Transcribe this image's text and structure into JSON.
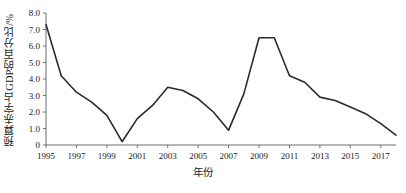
{
  "chart_data": {
    "type": "line",
    "title": "",
    "xlabel": "年份",
    "ylabel": "预算赤字占GDP的百分比/%",
    "xlim": [
      1995,
      2018
    ],
    "ylim": [
      0,
      8.0
    ],
    "grid": false,
    "legend": "none",
    "line_color": "#2b2b2b",
    "x": [
      1995,
      1996,
      1997,
      1998,
      1999,
      2000,
      2001,
      2002,
      2003,
      2004,
      2005,
      2006,
      2007,
      2008,
      2009,
      2010,
      2011,
      2012,
      2013,
      2014,
      2015,
      2016,
      2017,
      2018
    ],
    "values": [
      7.3,
      4.2,
      3.2,
      2.6,
      1.8,
      0.2,
      1.6,
      2.4,
      3.5,
      3.3,
      2.8,
      2.0,
      0.9,
      3.1,
      6.5,
      6.5,
      4.2,
      3.8,
      2.9,
      2.7,
      2.3,
      1.9,
      1.3,
      0.6
    ],
    "series": [
      {
        "name": "预算赤字占GDP的百分比",
        "values": [
          7.3,
          4.2,
          3.2,
          2.6,
          1.8,
          0.2,
          1.6,
          2.4,
          3.5,
          3.3,
          2.8,
          2.0,
          0.9,
          3.1,
          6.5,
          6.5,
          4.2,
          3.8,
          2.9,
          2.7,
          2.3,
          1.9,
          1.3,
          0.6
        ]
      }
    ],
    "x_tick_labels": [
      "1995",
      "1997",
      "1999",
      "2001",
      "2003",
      "2005",
      "2007",
      "2009",
      "2011",
      "2013",
      "2015",
      "2017"
    ],
    "x_tick_values": [
      1995,
      1997,
      1999,
      2001,
      2003,
      2005,
      2007,
      2009,
      2011,
      2013,
      2015,
      2017
    ],
    "y_tick_labels": [
      "0",
      "1.0",
      "2.0",
      "3.0",
      "4.0",
      "5.0",
      "6.0",
      "7.0",
      "8.0"
    ],
    "y_tick_values": [
      0,
      1,
      2,
      3,
      4,
      5,
      6,
      7,
      8
    ]
  }
}
